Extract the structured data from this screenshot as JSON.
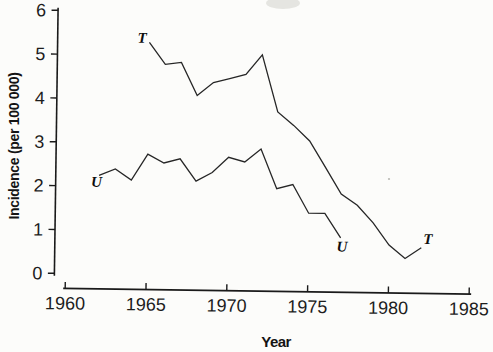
{
  "page": {
    "background_color": "#fcfcfa",
    "ink_color": "#1a1a1a"
  },
  "chart_data": {
    "type": "line",
    "title": "",
    "xlabel": "Year",
    "ylabel": "Incidence (per 100 000)",
    "xlim": [
      1960,
      1985
    ],
    "ylim": [
      0,
      6
    ],
    "x_ticks": [
      1960,
      1965,
      1970,
      1975,
      1980,
      1985
    ],
    "y_ticks": [
      0,
      1,
      2,
      3,
      4,
      5,
      6
    ],
    "grid": false,
    "legend_position": "none",
    "line_color": "#262626",
    "axis_color": "#1a1a1a",
    "series": [
      {
        "name": "T",
        "x": [
          1965,
          1966,
          1967,
          1968,
          1969,
          1970,
          1971,
          1972,
          1973,
          1974,
          1975,
          1976,
          1977,
          1978,
          1979,
          1980,
          1981,
          1982
        ],
        "values": [
          5.3,
          4.8,
          4.85,
          4.1,
          4.4,
          4.5,
          4.6,
          5.05,
          3.75,
          3.45,
          3.1,
          2.5,
          1.9,
          1.65,
          1.25,
          0.75,
          0.45,
          0.7
        ]
      },
      {
        "name": "U",
        "x": [
          1962,
          1963,
          1964,
          1965,
          1966,
          1967,
          1968,
          1969,
          1970,
          1971,
          1972,
          1973,
          1974,
          1975,
          1976,
          1977
        ],
        "values": [
          2.25,
          2.4,
          2.15,
          2.75,
          2.55,
          2.65,
          2.15,
          2.35,
          2.7,
          2.6,
          2.9,
          2.0,
          2.1,
          1.45,
          1.45,
          0.9
        ]
      }
    ],
    "annotations": [
      {
        "text": "T",
        "series": "T",
        "role": "start-label",
        "year": 1964.55,
        "value": 5.4
      },
      {
        "text": "T",
        "series": "T",
        "role": "end-label",
        "year": 1982.4,
        "value": 0.9
      },
      {
        "text": "U",
        "series": "U",
        "role": "start-label",
        "year": 1961.85,
        "value": 2.1
      },
      {
        "text": "U",
        "series": "U",
        "role": "end-label",
        "year": 1977.1,
        "value": 0.7
      }
    ]
  }
}
